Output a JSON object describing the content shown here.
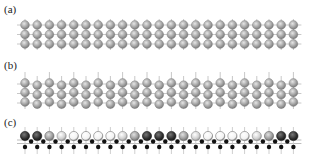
{
  "figure": {
    "panels": [
      {
        "label": "(a)",
        "label_pos": [
          4,
          4
        ],
        "type": "square-lattice",
        "rows_y": [
          25,
          34.5,
          44
        ],
        "x_start": 25,
        "spacing": 12.2,
        "count": 23,
        "atom_color": "#a8a8a8",
        "bond_color": "#c8c8c8",
        "stick_up": true,
        "stick_down": true
      },
      {
        "label": "(b)",
        "label_pos": [
          4,
          60
        ],
        "type": "square-lattice-buckled",
        "rows_y": [
          84,
          93.5,
          103
        ],
        "x_start": 25,
        "spacing": 12.2,
        "count": 23,
        "atom_color": "#a8a8a8",
        "bond_color": "#c8c8c8",
        "stick_up": true,
        "stick_down": true
      },
      {
        "label": "(c)",
        "label_pos": [
          4,
          117
        ],
        "type": "bilayer-modulated",
        "top_row_y": 136,
        "x_start": 25,
        "spacing": 12.2,
        "count": 23,
        "top_atom_shades": [
          "dark",
          "dark",
          "gray",
          "light",
          "white",
          "white",
          "white",
          "white",
          "light",
          "gray",
          "dark",
          "dark",
          "dark",
          "gray",
          "light",
          "white",
          "white",
          "white",
          "white",
          "light",
          "gray",
          "dark",
          "dark"
        ],
        "small_row_mid_y": 141.5,
        "small_row_low_y": 147,
        "small_atom_color": "#111111"
      }
    ],
    "shade_colors": {
      "dark": "#3a3a3a",
      "gray": "#9a9a9a",
      "light": "#c8c8c8",
      "white": "#f4f4f4"
    }
  }
}
